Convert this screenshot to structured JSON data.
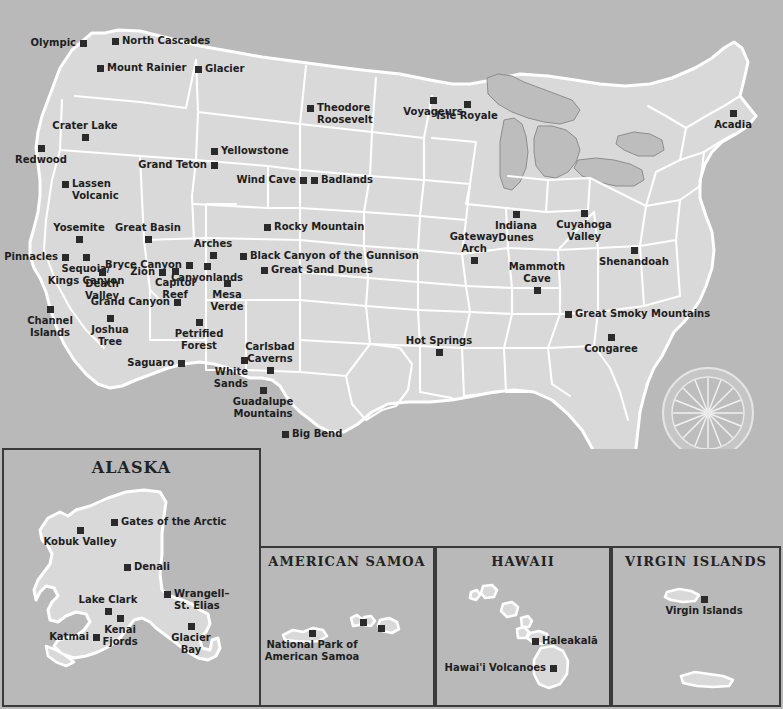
{
  "map": {
    "title": "United States National Parks Map",
    "colors": {
      "ocean": "#b9b9b9",
      "land": "#d9d9d9",
      "border": "#ffffff",
      "marker": "#2b2b2b",
      "lake": "#bdbdbd",
      "panel_border": "#3a3a3a",
      "label_text": "#1e1e1e"
    },
    "compass": {
      "name": "compass-rose"
    },
    "parks": [
      {
        "name": "Olympic",
        "x": 83,
        "y": 43,
        "pos": "l"
      },
      {
        "name": "North Cascades",
        "x": 115,
        "y": 41,
        "pos": "r"
      },
      {
        "name": "Mount Rainier",
        "x": 100,
        "y": 68,
        "pos": "r"
      },
      {
        "name": "Glacier",
        "x": 198,
        "y": 69,
        "pos": "r"
      },
      {
        "name": "Theodore\nRoosevelt",
        "x": 310,
        "y": 108,
        "pos": "r"
      },
      {
        "name": "Voyageurs",
        "x": 433,
        "y": 100,
        "pos": "b"
      },
      {
        "name": "Isle Royale",
        "x": 467,
        "y": 104,
        "pos": "b"
      },
      {
        "name": "Acadia",
        "x": 733,
        "y": 113,
        "pos": "b"
      },
      {
        "name": "Crater Lake",
        "x": 85,
        "y": 137,
        "pos": "t"
      },
      {
        "name": "Redwood",
        "x": 41,
        "y": 148,
        "pos": "b"
      },
      {
        "name": "Yellowstone",
        "x": 214,
        "y": 151,
        "pos": "r"
      },
      {
        "name": "Grand Teton",
        "x": 214,
        "y": 165,
        "pos": "l"
      },
      {
        "name": "Wind Cave",
        "x": 303,
        "y": 180,
        "pos": "l"
      },
      {
        "name": "Badlands",
        "x": 314,
        "y": 180,
        "pos": "r"
      },
      {
        "name": "Lassen\nVolcanic",
        "x": 65,
        "y": 184,
        "pos": "r"
      },
      {
        "name": "Yosemite",
        "x": 79,
        "y": 239,
        "pos": "t"
      },
      {
        "name": "Great Basin",
        "x": 148,
        "y": 239,
        "pos": "t"
      },
      {
        "name": "Rocky Mountain",
        "x": 267,
        "y": 227,
        "pos": "r"
      },
      {
        "name": "Arches",
        "x": 213,
        "y": 255,
        "pos": "t"
      },
      {
        "name": "Black Canyon of the Gunnison",
        "x": 243,
        "y": 256,
        "pos": "r"
      },
      {
        "name": "Pinnacles",
        "x": 65,
        "y": 257,
        "pos": "l"
      },
      {
        "name": "Sequoia/\nKings Canyon",
        "x": 86,
        "y": 257,
        "pos": "b"
      },
      {
        "name": "Bryce Canyon",
        "x": 189,
        "y": 265,
        "pos": "l"
      },
      {
        "name": "Canyonlands",
        "x": 207,
        "y": 266,
        "pos": "b"
      },
      {
        "name": "Great Sand Dunes",
        "x": 264,
        "y": 270,
        "pos": "r"
      },
      {
        "name": "Zion",
        "x": 162,
        "y": 272,
        "pos": "l"
      },
      {
        "name": "Capitol\nReef",
        "x": 175,
        "y": 271,
        "pos": "b"
      },
      {
        "name": "Death\nValley",
        "x": 102,
        "y": 272,
        "pos": "b"
      },
      {
        "name": "Mesa\nVerde",
        "x": 227,
        "y": 283,
        "pos": "b"
      },
      {
        "name": "Grand Canyon",
        "x": 177,
        "y": 302,
        "pos": "l"
      },
      {
        "name": "Channel\nIslands",
        "x": 50,
        "y": 309,
        "pos": "b"
      },
      {
        "name": "Joshua\nTree",
        "x": 110,
        "y": 318,
        "pos": "b"
      },
      {
        "name": "Petrified\nForest",
        "x": 199,
        "y": 322,
        "pos": "b"
      },
      {
        "name": "Great Smoky Mountains",
        "x": 568,
        "y": 314,
        "pos": "r"
      },
      {
        "name": "Hot Springs",
        "x": 439,
        "y": 352,
        "pos": "t"
      },
      {
        "name": "Congaree",
        "x": 611,
        "y": 337,
        "pos": "b"
      },
      {
        "name": "Saguaro",
        "x": 181,
        "y": 363,
        "pos": "l"
      },
      {
        "name": "White\nSands",
        "x": 244,
        "y": 360,
        "pos": "bl"
      },
      {
        "name": "Carlsbad\nCaverns",
        "x": 270,
        "y": 370,
        "pos": "t"
      },
      {
        "name": "Guadalupe\nMountains",
        "x": 263,
        "y": 390,
        "pos": "b"
      },
      {
        "name": "Big Bend",
        "x": 285,
        "y": 434,
        "pos": "r"
      },
      {
        "name": "Gateway\nArch",
        "x": 474,
        "y": 260,
        "pos": "t"
      },
      {
        "name": "Indiana\nDunes",
        "x": 516,
        "y": 214,
        "pos": "b"
      },
      {
        "name": "Cuyahoga\nValley",
        "x": 584,
        "y": 213,
        "pos": "b"
      },
      {
        "name": "Shenandoah",
        "x": 634,
        "y": 250,
        "pos": "b"
      },
      {
        "name": "Mammoth\nCave",
        "x": 537,
        "y": 290,
        "pos": "t"
      },
      {
        "name": "Biscayne",
        "x": 640,
        "y": 490,
        "pos": "r"
      },
      {
        "name": "Everglades",
        "x": 628,
        "y": 503,
        "pos": "b"
      },
      {
        "name": "Dry Tortugas",
        "x": 594,
        "y": 519,
        "pos": "l"
      }
    ],
    "insets": [
      {
        "id": "alaska",
        "title": "ALASKA",
        "parks": [
          {
            "name": "Gates of the Arctic",
            "x": 110,
            "y": 72,
            "pos": "r"
          },
          {
            "name": "Kobuk Valley",
            "x": 76,
            "y": 80,
            "pos": "b"
          },
          {
            "name": "Denali",
            "x": 123,
            "y": 117,
            "pos": "r"
          },
          {
            "name": "Wrangell–\nSt. Elias",
            "x": 163,
            "y": 144,
            "pos": "r"
          },
          {
            "name": "Lake Clark",
            "x": 104,
            "y": 161,
            "pos": "t"
          },
          {
            "name": "Kenai\nFjords",
            "x": 116,
            "y": 168,
            "pos": "b"
          },
          {
            "name": "Glacier\nBay",
            "x": 187,
            "y": 176,
            "pos": "b"
          },
          {
            "name": "Katmai",
            "x": 92,
            "y": 187,
            "pos": "l"
          }
        ]
      },
      {
        "id": "samoa",
        "title": "AMERICAN SAMOA",
        "parks": [
          {
            "name": "National Park of\nAmerican Samoa",
            "x": 51,
            "y": 85,
            "pos": "b"
          }
        ],
        "extra_markers": [
          {
            "x": 102,
            "y": 74
          },
          {
            "x": 120,
            "y": 80
          }
        ]
      },
      {
        "id": "hawaii",
        "title": "HAWAII",
        "parks": [
          {
            "name": "Haleakalā",
            "x": 98,
            "y": 93,
            "pos": "r"
          },
          {
            "name": "Hawai'i Volcanoes",
            "x": 116,
            "y": 120,
            "pos": "l"
          }
        ]
      },
      {
        "id": "vi",
        "title": "VIRGIN ISLANDS",
        "parks": [
          {
            "name": "Virgin Islands",
            "x": 91,
            "y": 51,
            "pos": "b"
          }
        ]
      }
    ]
  }
}
